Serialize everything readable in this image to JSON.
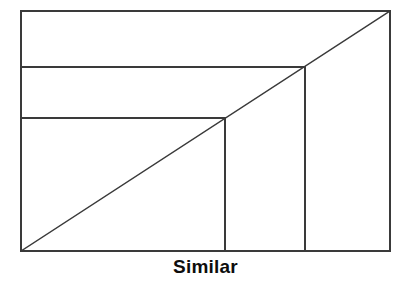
{
  "figure": {
    "caption": "Similar",
    "colors": {
      "background": "#ffffff",
      "stroke": "#3a3a3a",
      "caption_text": "#0d0d0d"
    },
    "stroke_width": 2,
    "outer_rectangle": {
      "name": "outer-rectangle",
      "x": 21,
      "y": 11,
      "width": 369,
      "height": 240
    },
    "diagonal": {
      "name": "shared-diagonal",
      "x1": 21,
      "y1": 251,
      "x2": 390,
      "y2": 11
    },
    "nested_rectangles": [
      {
        "name": "nested-rectangle-medium",
        "x": 21,
        "y": 67,
        "width": 284,
        "height": 184
      },
      {
        "name": "nested-rectangle-small",
        "x": 21,
        "y": 118,
        "width": 204,
        "height": 133
      }
    ],
    "internal_lines": [
      {
        "name": "horizontal-divider-upper",
        "x1": 21,
        "y1": 67,
        "x2": 305,
        "y2": 67
      },
      {
        "name": "horizontal-divider-lower",
        "x1": 21,
        "y1": 118,
        "x2": 225,
        "y2": 118
      },
      {
        "name": "vertical-divider-right",
        "x1": 305,
        "y1": 67,
        "x2": 305,
        "y2": 251
      },
      {
        "name": "vertical-divider-left",
        "x1": 225,
        "y1": 118,
        "x2": 225,
        "y2": 251
      }
    ]
  }
}
